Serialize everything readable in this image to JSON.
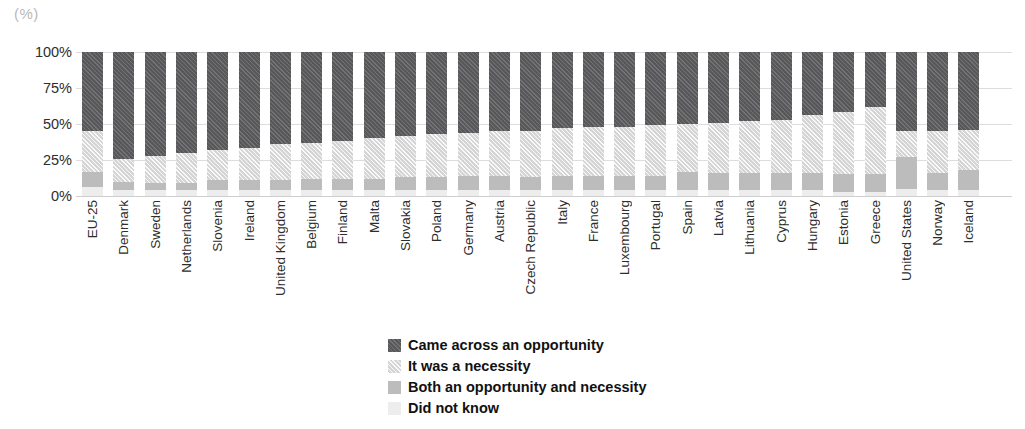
{
  "axis_unit_label": "(%)",
  "yticks": [
    "100%",
    "75%",
    "50%",
    "25%",
    "0%"
  ],
  "legend": {
    "items": [
      {
        "label": "Came across an opportunity",
        "swatch": "dark-hatch-swatch"
      },
      {
        "label": "It was a necessity",
        "swatch": "light-hatch-swatch"
      },
      {
        "label": "Both an opportunity and necessity",
        "swatch": "mid-grey-swatch"
      },
      {
        "label": "Did not know",
        "swatch": "pale-grey-swatch"
      }
    ]
  },
  "chart_data": {
    "type": "bar",
    "subtype": "stacked-100-percent",
    "title": "",
    "subtitle": "",
    "xlabel": "",
    "ylabel": "(%)",
    "ylim": [
      0,
      100
    ],
    "ytick_values": [
      0,
      25,
      50,
      75,
      100
    ],
    "grid": true,
    "legend_position": "bottom-center",
    "orientation": "vertical",
    "colors": {
      "came_across_an_opportunity": "#58585a",
      "it_was_a_necessity": "#d5d5d5",
      "both_an_opportunity_and_necessity": "#bcbcbc",
      "did_not_know": "#ededed"
    },
    "categories": [
      "EU-25",
      "Denmark",
      "Sweden",
      "Netherlands",
      "Slovenia",
      "Ireland",
      "United Kingdom",
      "Belgium",
      "Finland",
      "Malta",
      "Slovakia",
      "Poland",
      "Germany",
      "Austria",
      "Czech Republic",
      "Italy",
      "France",
      "Luxembourg",
      "Portugal",
      "Spain",
      "Latvia",
      "Lithuania",
      "Cyprus",
      "Hungary",
      "Estonia",
      "Greece",
      "United States",
      "Norway",
      "Iceland"
    ],
    "series": [
      {
        "name": "Came across an opportunity",
        "values": [
          55,
          74,
          72,
          70,
          68,
          67,
          64,
          63,
          62,
          60,
          58,
          57,
          56,
          55,
          55,
          53,
          52,
          52,
          51,
          50,
          49,
          48,
          47,
          44,
          42,
          38,
          55,
          55,
          54
        ]
      },
      {
        "name": "It was a necessity",
        "values": [
          28,
          16,
          19,
          21,
          21,
          22,
          25,
          25,
          26,
          28,
          29,
          30,
          30,
          31,
          32,
          33,
          34,
          34,
          35,
          33,
          35,
          36,
          37,
          40,
          43,
          47,
          18,
          29,
          28
        ]
      },
      {
        "name": "Both an opportunity and necessity",
        "values": [
          11,
          6,
          5,
          5,
          7,
          7,
          7,
          8,
          8,
          8,
          9,
          9,
          10,
          10,
          9,
          10,
          10,
          10,
          10,
          13,
          12,
          12,
          12,
          12,
          12,
          12,
          22,
          12,
          14
        ]
      },
      {
        "name": "Did not know",
        "values": [
          6,
          4,
          4,
          4,
          4,
          4,
          4,
          4,
          4,
          4,
          4,
          4,
          4,
          4,
          4,
          4,
          4,
          4,
          4,
          4,
          4,
          4,
          4,
          4,
          3,
          3,
          5,
          4,
          4
        ]
      }
    ]
  }
}
